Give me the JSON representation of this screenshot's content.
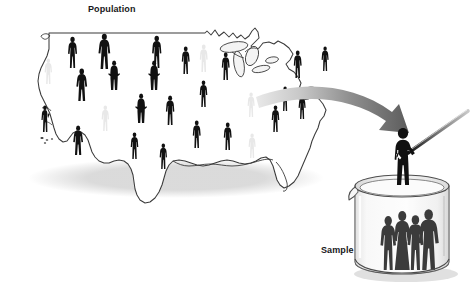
{
  "figure": {
    "type": "diagram",
    "concept": "statistical-sampling",
    "background_color": "#ffffff",
    "width": 474,
    "height": 287
  },
  "labels": {
    "population": "Population",
    "sample": "Sample"
  },
  "colors": {
    "figure_dark": "#111111",
    "figure_ghost": "#e8e8e8",
    "map_outline": "#3b3b3b",
    "map_fill": "#ffffff",
    "arrow_dark": "#4a4a4a",
    "arrow_light": "#d2d2d2",
    "beaker_glass": "#f2f2f2",
    "beaker_outline": "#4d4d4d",
    "shadow": "#cfcfcf",
    "text": "#17171a"
  },
  "map": {
    "name": "united-states-outline",
    "northern_border_line": {
      "x1": 50,
      "y1": 33,
      "x2": 205,
      "y2": 33
    },
    "outline_path": "M 49,33 L 205,33 L 206,32 L 212,34 L 216,31 L 222,35 L 228,33 L 234,37 L 239,34 L 243,38 L 248,36 L 251,33 L 254,29 L 257,33 L 258,39 L 254,43 L 250,47 L 253,50 L 258,48 L 262,44 L 268,43 L 273,45 L 277,42 L 283,45 L 288,49 L 292,55 L 289,60 L 285,64 L 288,69 L 293,72 L 297,77 L 300,83 L 298,89 L 294,93 L 296,98 L 301,100 L 307,99 L 313,96 L 318,99 L 322,104 L 325,110 L 323,116 L 319,121 L 317,128 L 314,134 L 311,141 L 309,148 L 306,155 L 303,162 L 300,169 L 297,176 L 293,182 L 288,186 L 283,188 L 279,185 L 276,180 L 274,173 L 272,166 L 269,160 L 265,157 L 260,158 L 255,161 L 250,163 L 244,164 L 238,163 L 232,161 L 226,160 L 220,161 L 214,163 L 208,165 L 202,166 L 196,165 L 190,163 L 184,161 L 178,160 L 172,161 L 168,165 L 165,171 L 163,178 L 161,185 L 158,192 L 154,198 L 149,202 L 144,203 L 139,200 L 136,195 L 134,189 L 133,182 L 132,175 L 130,169 L 127,164 L 123,161 L 118,160 L 113,161 L 108,163 L 103,163 L 98,161 L 94,157 L 91,152 L 89,146 L 87,140 L 84,135 L 80,132 L 76,131 L 72,133 L 69,137 L 66,141 L 62,142 L 58,139 L 55,134 L 53,128 L 51,121 L 49,114 L 46,107 L 43,101 L 40,95 L 38,88 L 37,81 L 38,74 L 40,68 L 43,62 L 46,56 L 48,49 L 49,42 Z",
    "coast_detail_paths": [
      "M 38,38 L 42,35 L 46,36 L 48,40 L 45,43 L 41,42 Z",
      "M 205,33 L 209,40 L 214,44 L 219,41 L 223,45 L 220,51 L 216,49 L 212,46 L 208,42 Z"
    ],
    "great_lakes": [
      {
        "name": "lake-michigan",
        "cx": 238,
        "cy": 62,
        "rx": 5,
        "ry": 12,
        "rot": -12
      },
      {
        "name": "lake-superior",
        "cx": 232,
        "cy": 46,
        "rx": 13,
        "ry": 5,
        "rot": -8
      },
      {
        "name": "lake-huron",
        "cx": 250,
        "cy": 54,
        "rx": 6,
        "ry": 9,
        "rot": 18
      },
      {
        "name": "lake-erie",
        "cx": 258,
        "cy": 67,
        "rx": 8,
        "ry": 3,
        "rot": -10
      },
      {
        "name": "lake-ontario",
        "cx": 268,
        "cy": 58,
        "rx": 6,
        "ry": 3,
        "rot": -10
      }
    ],
    "florida_path": "M 292,150 L 296,158 L 299,166 L 301,174 L 300,181 L 296,185 L 292,183 L 290,177 L 289,169 L 288,161 L 288,154 Z",
    "texas_notch": "M 150,150 L 156,158 L 160,166 L 164,172 L 170,174 L 176,172 L 180,166"
  },
  "people_on_map": [
    {
      "id": 1,
      "x": 66,
      "y": 36,
      "h": 32,
      "tone": "dark",
      "pose": "standing"
    },
    {
      "id": 2,
      "x": 97,
      "y": 33,
      "h": 36,
      "tone": "dark",
      "pose": "standing-wide"
    },
    {
      "id": 3,
      "x": 150,
      "y": 35,
      "h": 33,
      "tone": "dark",
      "pose": "standing"
    },
    {
      "id": 4,
      "x": 180,
      "y": 46,
      "h": 28,
      "tone": "dark",
      "pose": "standing"
    },
    {
      "id": 5,
      "x": 198,
      "y": 44,
      "h": 28,
      "tone": "ghost",
      "pose": "standing"
    },
    {
      "id": 6,
      "x": 220,
      "y": 52,
      "h": 28,
      "tone": "dark",
      "pose": "standing"
    },
    {
      "id": 7,
      "x": 292,
      "y": 50,
      "h": 28,
      "tone": "dark",
      "pose": "standing"
    },
    {
      "id": 8,
      "x": 320,
      "y": 46,
      "h": 25,
      "tone": "dark",
      "pose": "standing"
    },
    {
      "id": 9,
      "x": 43,
      "y": 58,
      "h": 26,
      "tone": "ghost",
      "pose": "standing"
    },
    {
      "id": 10,
      "x": 75,
      "y": 68,
      "h": 33,
      "tone": "dark",
      "pose": "standing-wide"
    },
    {
      "id": 11,
      "x": 108,
      "y": 60,
      "h": 30,
      "tone": "dark",
      "pose": "hands-on-hips"
    },
    {
      "id": 12,
      "x": 148,
      "y": 60,
      "h": 30,
      "tone": "dark",
      "pose": "hands-on-hips"
    },
    {
      "id": 13,
      "x": 198,
      "y": 80,
      "h": 27,
      "tone": "dark",
      "pose": "standing"
    },
    {
      "id": 14,
      "x": 246,
      "y": 92,
      "h": 25,
      "tone": "ghost",
      "pose": "standing"
    },
    {
      "id": 15,
      "x": 280,
      "y": 86,
      "h": 25,
      "tone": "dark",
      "pose": "standing"
    },
    {
      "id": 16,
      "x": 40,
      "y": 105,
      "h": 27,
      "tone": "dark",
      "pose": "waving"
    },
    {
      "id": 17,
      "x": 100,
      "y": 105,
      "h": 26,
      "tone": "ghost",
      "pose": "standing"
    },
    {
      "id": 18,
      "x": 135,
      "y": 93,
      "h": 30,
      "tone": "dark",
      "pose": "hands-on-hips"
    },
    {
      "id": 19,
      "x": 164,
      "y": 95,
      "h": 30,
      "tone": "dark",
      "pose": "standing"
    },
    {
      "id": 20,
      "x": 270,
      "y": 105,
      "h": 27,
      "tone": "dark",
      "pose": "standing"
    },
    {
      "id": 21,
      "x": 297,
      "y": 94,
      "h": 25,
      "tone": "dark",
      "pose": "standing"
    },
    {
      "id": 22,
      "x": 72,
      "y": 125,
      "h": 30,
      "tone": "dark",
      "pose": "standing-wide"
    },
    {
      "id": 23,
      "x": 129,
      "y": 132,
      "h": 27,
      "tone": "dark",
      "pose": "standing"
    },
    {
      "id": 24,
      "x": 158,
      "y": 143,
      "h": 26,
      "tone": "dark",
      "pose": "standing"
    },
    {
      "id": 25,
      "x": 191,
      "y": 120,
      "h": 28,
      "tone": "dark",
      "pose": "standing"
    },
    {
      "id": 26,
      "x": 222,
      "y": 122,
      "h": 28,
      "tone": "dark",
      "pose": "standing"
    },
    {
      "id": 27,
      "x": 247,
      "y": 133,
      "h": 25,
      "tone": "ghost",
      "pose": "standing"
    }
  ],
  "arrow": {
    "name": "sampling-arrow",
    "description": "curved gray arrow from the eastern map toward the beaker",
    "start": {
      "x": 258,
      "y": 100
    },
    "end": {
      "x": 404,
      "y": 128
    },
    "control": {
      "x": 352,
      "y": 88
    },
    "head_size": 17
  },
  "beaker": {
    "name": "sample-beaker",
    "rim": {
      "cx": 402,
      "cy": 186,
      "rx": 47,
      "ry": 11
    },
    "body": {
      "left": 355,
      "right": 449,
      "top": 186,
      "bottom": 273
    },
    "spout": {
      "x": 352,
      "y": 192
    },
    "people_inside": [
      {
        "id": "a",
        "x": 377,
        "y": 215,
        "h": 55,
        "tone": "dark",
        "pose": "standing"
      },
      {
        "id": "b",
        "x": 390,
        "y": 210,
        "h": 60,
        "tone": "dark",
        "pose": "dress"
      },
      {
        "id": "c",
        "x": 404,
        "y": 214,
        "h": 56,
        "tone": "dark",
        "pose": "standing"
      },
      {
        "id": "d",
        "x": 416,
        "y": 208,
        "h": 62,
        "tone": "dark",
        "pose": "standing-wide"
      }
    ]
  },
  "sampler": {
    "name": "person-with-fishing-rod",
    "x": 403,
    "y": 128,
    "height": 57,
    "rod": {
      "x1": 409,
      "y1": 152,
      "x2": 467,
      "y2": 112
    },
    "tone": "dark"
  }
}
